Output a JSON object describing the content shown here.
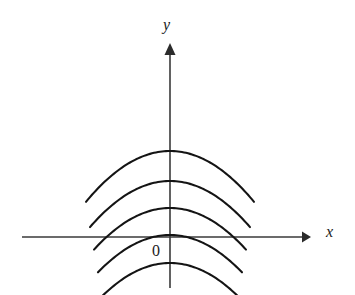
{
  "figure": {
    "background_color": "#ffffff",
    "width": 355,
    "height": 295
  },
  "labels": {
    "y_axis": "y",
    "x_axis": "x",
    "origin": "0"
  },
  "colors": {
    "curve": "#141414",
    "axis": "#3a3a3a",
    "arrowhead": "#2b2b2b",
    "text": "#1a1a1a",
    "background": "#ffffff"
  },
  "chart_data": {
    "type": "line",
    "title": "",
    "xlabel": "x",
    "ylabel": "y",
    "grid": false,
    "legend": "none",
    "axes": {
      "origin_px": {
        "x": 170,
        "y": 237
      },
      "x_axis_px": {
        "start_x": 22,
        "end_x": 311,
        "y": 237,
        "arrow": "right"
      },
      "y_axis_px": {
        "x": 170,
        "start_y": 285,
        "end_y": 44,
        "arrow": "up"
      },
      "xlim": [
        -20.5,
        19.6
      ],
      "ylim": [
        -6.7,
        26.8
      ],
      "px_per_unit_x": 7.2,
      "px_per_unit_y": 7.2
    },
    "series": [
      {
        "name": "C5 (topmost)",
        "vertex_px": {
          "x": 170,
          "y": 151
        },
        "vertex_value": {
          "x": 0,
          "y": 11.9
        },
        "curvature_px": 0.0072,
        "x_half_span_px": 84,
        "endpoints_px": [
          {
            "x": 86,
            "y": 202
          },
          {
            "x": 254,
            "y": 202
          }
        ]
      },
      {
        "name": "C4",
        "vertex_px": {
          "x": 170,
          "y": 181
        },
        "vertex_value": {
          "x": 0,
          "y": 7.8
        },
        "curvature_px": 0.0072,
        "x_half_span_px": 80,
        "endpoints_px": [
          {
            "x": 90,
            "y": 227
          },
          {
            "x": 250,
            "y": 227
          }
        ]
      },
      {
        "name": "C3",
        "vertex_px": {
          "x": 170,
          "y": 208
        },
        "vertex_value": {
          "x": 0,
          "y": 4.0
        },
        "curvature_px": 0.0072,
        "x_half_span_px": 76,
        "endpoints_px": [
          {
            "x": 94,
            "y": 250
          },
          {
            "x": 246,
            "y": 250
          }
        ]
      },
      {
        "name": "C2",
        "vertex_px": {
          "x": 170,
          "y": 235
        },
        "vertex_value": {
          "x": 0,
          "y": 0.3
        },
        "curvature_px": 0.0072,
        "x_half_span_px": 72,
        "endpoints_px": [
          {
            "x": 98,
            "y": 272
          },
          {
            "x": 242,
            "y": 272
          }
        ]
      },
      {
        "name": "C1 (lowest)",
        "vertex_px": {
          "x": 170,
          "y": 263
        },
        "vertex_value": {
          "x": 0,
          "y": -3.6
        },
        "curvature_px": 0.0072,
        "x_half_span_px": 68,
        "endpoints_px": [
          {
            "x": 102,
            "y": 296
          },
          {
            "x": 238,
            "y": 296
          }
        ],
        "x_intercepts_value": [
          -16.1,
          16.1
        ]
      }
    ]
  }
}
